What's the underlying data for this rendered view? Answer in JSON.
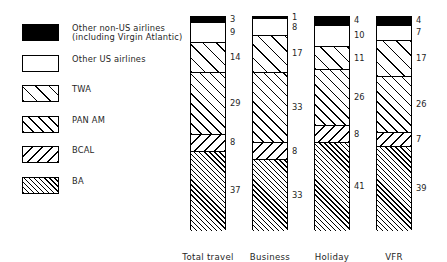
{
  "chart_data": {
    "type": "bar",
    "subtype": "stacked-percentage-column",
    "title": "",
    "subtitle": "",
    "xlabel": "",
    "ylabel": "",
    "ylim": [
      0,
      100
    ],
    "grid": false,
    "legend_position": "left",
    "categories": [
      "Total travel",
      "Business",
      "Holiday",
      "VFR"
    ],
    "series": [
      {
        "name": "Other non-US airlines (including Virgin Atlantic)",
        "short_name": "Other non-US airlines",
        "pattern": "solid-black",
        "values": [
          3,
          1,
          4,
          4
        ]
      },
      {
        "name": "Other US airlines",
        "short_name": "Other US airlines",
        "pattern": "white",
        "values": [
          9,
          8,
          10,
          7
        ]
      },
      {
        "name": "TWA",
        "short_name": "TWA",
        "pattern": "diagonal-wide-up",
        "values": [
          14,
          17,
          11,
          17
        ]
      },
      {
        "name": "PAN AM",
        "short_name": "PAN AM",
        "pattern": "diagonal-medium-up",
        "values": [
          29,
          33,
          26,
          26
        ]
      },
      {
        "name": "BCAL",
        "short_name": "BCAL",
        "pattern": "diagonal-medium-down",
        "values": [
          8,
          8,
          8,
          7
        ]
      },
      {
        "name": "BA",
        "short_name": "BA",
        "pattern": "diagonal-dense-up",
        "values": [
          37,
          33,
          41,
          39
        ]
      }
    ]
  },
  "legend": {
    "items": [
      {
        "label": "Other non-US airlines\n(including Virgin Atlantic)",
        "pattern": "solid-black"
      },
      {
        "label": "Other US airlines",
        "pattern": "white"
      },
      {
        "label": "TWA",
        "pattern": "diagonal-wide-up"
      },
      {
        "label": "PAN AM",
        "pattern": "diagonal-medium-up"
      },
      {
        "label": "BCAL",
        "pattern": "diagonal-medium-down"
      },
      {
        "label": "BA",
        "pattern": "diagonal-dense-up"
      }
    ]
  },
  "colors": {
    "ink": "#000000",
    "background": "#ffffff",
    "text": "#1f1f1f"
  }
}
